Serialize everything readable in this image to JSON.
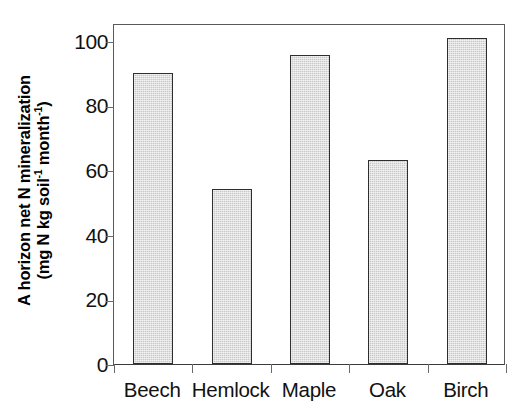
{
  "chart_data": {
    "type": "bar",
    "title": "",
    "subtitle": "",
    "xlabel": "",
    "ylabel_line1": "A horizon net N mineralization",
    "ylabel_line2_prefix": "(mg N kg soil",
    "ylabel_line2_sup1": "-1",
    "ylabel_line2_mid": " month",
    "ylabel_line2_sup2": "-1",
    "ylabel_line2_suffix": ")",
    "categories": [
      "Beech",
      "Hemlock",
      "Maple",
      "Oak",
      "Birch"
    ],
    "values": [
      90,
      54,
      95.5,
      63,
      101
    ],
    "ylim": [
      0,
      105.5
    ],
    "yticks": [
      0,
      20,
      40,
      60,
      80,
      100
    ],
    "ytick_labels": [
      "0",
      "20",
      "40",
      "60",
      "80",
      "100"
    ],
    "grid": false,
    "legend": "none",
    "bar_fill_color": "#c9c9c9",
    "bar_edge_color": "#2e2e2e",
    "axis_color": "#5a5a5a",
    "text_color": "#111111"
  }
}
